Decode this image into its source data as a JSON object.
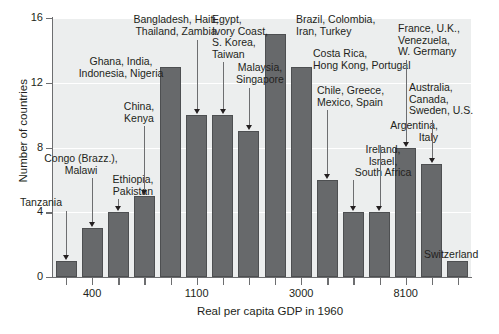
{
  "chart_data": {
    "type": "bar",
    "title": "",
    "xlabel": "Real per capita GDP in 1960",
    "ylabel": "Number of countries",
    "ylim": [
      0,
      16
    ],
    "yticks": [
      0,
      4,
      8,
      12,
      16
    ],
    "grid": true,
    "legend": "none",
    "categories": [
      "b1",
      "b2",
      "b3",
      "b4",
      "b5",
      "b6",
      "b7",
      "b8",
      "b9",
      "b10",
      "b11",
      "b12",
      "b13",
      "b14",
      "b15",
      "b16"
    ],
    "values": [
      1,
      3,
      4,
      5,
      13,
      10,
      10,
      9,
      15,
      13,
      6,
      4,
      4,
      8,
      7,
      1
    ],
    "xtick_labels": [
      "400",
      "1100",
      "3000",
      "8100"
    ],
    "xtick_bar_index": [
      1,
      5,
      9,
      13
    ],
    "annotations": [
      {
        "text": "Tanzania",
        "bar": 0,
        "align": "left"
      },
      {
        "text": "Congo (Brazz.),\nMalawi",
        "bar": 1,
        "align": "right"
      },
      {
        "text": "Ethiopia,\nPakistan",
        "bar": 2,
        "align": "left"
      },
      {
        "text": "China,\nKenya",
        "bar": 3,
        "align": "right"
      },
      {
        "text": "Ghana, India,\nIndonesia, Nigeria",
        "bar": 4,
        "align": "right"
      },
      {
        "text": "Bangladesh, Haiti,\nThailand, Zambia",
        "bar": 5,
        "align": "right"
      },
      {
        "text": "Egypt,\nIvory Coast,\nS. Korea,\nTaiwan",
        "bar": 6,
        "align": "left"
      },
      {
        "text": "Malaysia,\nSingapore",
        "bar": 7,
        "align": "right"
      },
      {
        "text": "Brazil, Colombia,\nIran, Turkey",
        "bar": 8,
        "align": "left"
      },
      {
        "text": "Costa Rica,\nHong Kong, Portugal",
        "bar": 9,
        "align": "left"
      },
      {
        "text": "Chile, Greece,\nMexico, Spain",
        "bar": 10,
        "align": "left"
      },
      {
        "text": "Ireland,\nIsrael,\nSouth Africa",
        "bar": 11,
        "align": "left"
      },
      {
        "text": "Argentina,\nItaly",
        "bar": 12,
        "align": "right"
      },
      {
        "text": "France, U.K.,\nVenezuela,\nW. Germany",
        "bar": 13,
        "align": "left"
      },
      {
        "text": "Australia,\nCanada,\nSweden, U.S.",
        "bar": 14,
        "align": "left"
      },
      {
        "text": "Switzerland",
        "bar": 15,
        "align": "left"
      }
    ]
  },
  "axis": {
    "y_title": "Number of countries",
    "x_title": "Real per capita GDP in 1960",
    "y_tick_labels": [
      "0",
      "4",
      "8",
      "12",
      "16"
    ],
    "x_tick_labels": [
      "400",
      "1100",
      "3000",
      "8100"
    ]
  },
  "annotation_labels": {
    "a0": "Tanzania",
    "a1": "Congo (Brazz.),\nMalawi",
    "a2": "Ethiopia,\nPakistan",
    "a3": "China,\nKenya",
    "a4": "Ghana, India,\nIndonesia, Nigeria",
    "a5": "Bangladesh, Haiti,\nThailand, Zambia",
    "a6": "Egypt,\nIvory Coast,\nS. Korea,\nTaiwan",
    "a7": "Malaysia,\nSingapore",
    "a8": "Brazil, Colombia,\nIran, Turkey",
    "a9": "Costa Rica,\nHong Kong, Portugal",
    "a10": "Chile, Greece,\nMexico, Spain",
    "a11": "Ireland,\nIsrael,\nSouth Africa",
    "a12": "Argentina,\nItaly",
    "a13": "France, U.K.,\nVenezuela,\nW. Germany",
    "a14": "Australia,\nCanada,\nSweden, U.S.",
    "a15": "Switzerland"
  },
  "colors": {
    "bar_fill": "#67696b",
    "bar_stroke": "#4d4f51",
    "plot_bg": "#eceeee",
    "axis": "#6d6e70",
    "text": "#231f20",
    "gridline": "#ffffff"
  }
}
